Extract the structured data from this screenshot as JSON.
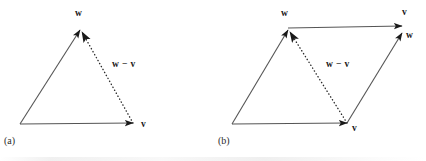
{
  "figure": {
    "background_color": "#ffffff",
    "stroke_color": "#555555",
    "text_color": "#1a1a1a",
    "panels": [
      {
        "id": "a",
        "caption": "(a)",
        "caption_x": 4,
        "caption_y": 136,
        "labels": [
          {
            "name": "w-head-label",
            "text": "w",
            "x": 75,
            "y": 9
          },
          {
            "name": "v-head-label",
            "text": "v",
            "x": 141,
            "y": 120
          },
          {
            "name": "w-minus-v-label",
            "text": "w − v",
            "x": 112,
            "y": 60
          }
        ],
        "vectors": [
          {
            "name": "vector-w",
            "style": "solid",
            "x1": 20,
            "y1": 124,
            "x2": 80,
            "y2": 30
          },
          {
            "name": "vector-v",
            "style": "solid",
            "x1": 20,
            "y1": 124,
            "x2": 133,
            "y2": 123
          },
          {
            "name": "vector-w-minus-v",
            "style": "dotted",
            "x1": 133,
            "y1": 123,
            "x2": 82,
            "y2": 32
          }
        ]
      },
      {
        "id": "b",
        "caption": "(b)",
        "caption_x": 218,
        "caption_y": 136,
        "labels": [
          {
            "name": "w-head-label",
            "text": "w",
            "x": 281,
            "y": 9
          },
          {
            "name": "v-top-head-label",
            "text": "v",
            "x": 402,
            "y": 8
          },
          {
            "name": "w-right-head-label",
            "text": "w",
            "x": 406,
            "y": 31
          },
          {
            "name": "v-bottom-head-label",
            "text": "v",
            "x": 352,
            "y": 124
          },
          {
            "name": "w-minus-v-label",
            "text": "w − v",
            "x": 326,
            "y": 60
          }
        ],
        "vectors": [
          {
            "name": "vector-w-left",
            "style": "solid",
            "x1": 232,
            "y1": 124,
            "x2": 288,
            "y2": 30
          },
          {
            "name": "vector-v-bottom",
            "style": "solid",
            "x1": 232,
            "y1": 124,
            "x2": 347,
            "y2": 123
          },
          {
            "name": "vector-v-top",
            "style": "solid",
            "x1": 288,
            "y1": 28,
            "x2": 402,
            "y2": 26
          },
          {
            "name": "vector-w-right",
            "style": "solid",
            "x1": 347,
            "y1": 123,
            "x2": 402,
            "y2": 33
          },
          {
            "name": "vector-w-minus-v",
            "style": "dotted",
            "x1": 347,
            "y1": 123,
            "x2": 290,
            "y2": 32
          }
        ]
      }
    ]
  }
}
